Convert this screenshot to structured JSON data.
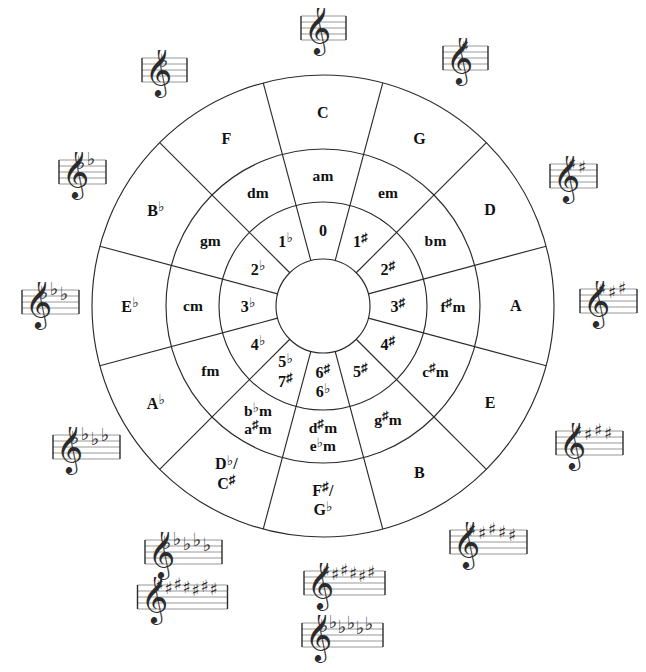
{
  "diagram": {
    "line_color": "#2b2b2b",
    "text_color": "#111111",
    "background": "#ffffff"
  },
  "rings": {
    "outer_major": {
      "name": "major-keys-ring",
      "sectors": [
        {
          "id": "C",
          "text": "C",
          "html": "C"
        },
        {
          "id": "G",
          "text": "G",
          "html": "G"
        },
        {
          "id": "D",
          "text": "D",
          "html": "D"
        },
        {
          "id": "A",
          "text": "A",
          "html": "A"
        },
        {
          "id": "E",
          "text": "E",
          "html": "E"
        },
        {
          "id": "B",
          "text": "B",
          "html": "B"
        },
        {
          "id": "Fs-Gb",
          "text": "F♯ / G♭",
          "html": "F<span class=\"acc-sup\">♯</span>/<span class=\"stack-line\">G<span class=\"acc\">♭</span></span>"
        },
        {
          "id": "Db-Cs",
          "text": "D♭ / C♯",
          "html": "D<span class=\"acc\">♭</span>/<span class=\"stack-line\">C<span class=\"acc-sup\">♯</span></span>"
        },
        {
          "id": "Ab",
          "text": "A♭",
          "html": "A<span class=\"acc\">♭</span>"
        },
        {
          "id": "Eb",
          "text": "E♭",
          "html": "E<span class=\"acc\">♭</span>"
        },
        {
          "id": "Bb",
          "text": "B♭",
          "html": "B<span class=\"acc\">♭</span>"
        },
        {
          "id": "F",
          "text": "F",
          "html": "F"
        }
      ]
    },
    "middle_minor": {
      "name": "relative-minor-keys-ring",
      "sectors": [
        {
          "id": "am",
          "text": "am",
          "html": "am"
        },
        {
          "id": "em",
          "text": "em",
          "html": "em"
        },
        {
          "id": "bm",
          "text": "bm",
          "html": "bm"
        },
        {
          "id": "fsm",
          "text": "f♯m",
          "html": "f<span class=\"acc-sup\">♯</span>m"
        },
        {
          "id": "csm",
          "text": "c♯m",
          "html": "c<span class=\"acc-sup\">♯</span>m"
        },
        {
          "id": "gsm",
          "text": "g♯m",
          "html": "g<span class=\"acc-sup\">♯</span>m"
        },
        {
          "id": "dsm-ebm",
          "text": "d♯m / e♭m",
          "html": "d<span class=\"acc-sup\">♯</span>m<span class=\"stack-line\">e<span class=\"acc\">♭</span>m</span>"
        },
        {
          "id": "bbm-asm",
          "text": "b♭m / a♯m",
          "html": "b<span class=\"acc\">♭</span>m<span class=\"stack-line\">a<span class=\"acc-sup\">♯</span>m</span>"
        },
        {
          "id": "fm",
          "text": "fm",
          "html": "fm"
        },
        {
          "id": "cm",
          "text": "cm",
          "html": "cm"
        },
        {
          "id": "gm",
          "text": "gm",
          "html": "gm"
        },
        {
          "id": "dm",
          "text": "dm",
          "html": "dm"
        }
      ]
    },
    "inner_counts": {
      "name": "accidental-count-ring",
      "sectors": [
        {
          "id": "0",
          "text": "0",
          "html": "0"
        },
        {
          "id": "1s",
          "text": "1♯",
          "html": "1<span class=\"acc-sup\">♯</span>"
        },
        {
          "id": "2s",
          "text": "2♯",
          "html": "2<span class=\"acc-sup\">♯</span>"
        },
        {
          "id": "3s",
          "text": "3♯",
          "html": "3<span class=\"acc-sup\">♯</span>"
        },
        {
          "id": "4s",
          "text": "4♯",
          "html": "4<span class=\"acc-sup\">♯</span>"
        },
        {
          "id": "5s",
          "text": "5♯",
          "html": "5<span class=\"acc-sup\">♯</span>"
        },
        {
          "id": "6s-6b",
          "text": "6♯ / 6♭",
          "html": "6<span class=\"acc-sup\">♯</span><span class=\"stack-line\">6<span class=\"acc\">♭</span></span>"
        },
        {
          "id": "5b-7s",
          "text": "5♭ / 7♯",
          "html": "5<span class=\"acc\">♭</span><span class=\"stack-line\">7<span class=\"acc-sup\">♯</span></span>"
        },
        {
          "id": "4b",
          "text": "4♭",
          "html": "4<span class=\"acc\">♭</span>"
        },
        {
          "id": "3b",
          "text": "3♭",
          "html": "3<span class=\"acc\">♭</span>"
        },
        {
          "id": "2b",
          "text": "2♭",
          "html": "2<span class=\"acc\">♭</span>"
        },
        {
          "id": "1b",
          "text": "1♭",
          "html": "1<span class=\"acc\">♭</span>"
        }
      ]
    }
  },
  "key_signatures": [
    {
      "id": "ks-C",
      "key": "C",
      "accidental": "none",
      "count": 0,
      "label": "C major — no sharps or flats"
    },
    {
      "id": "ks-G",
      "key": "G",
      "accidental": "sharp",
      "count": 1,
      "label": "G major — 1 sharp"
    },
    {
      "id": "ks-D",
      "key": "D",
      "accidental": "sharp",
      "count": 2,
      "label": "D major — 2 sharps"
    },
    {
      "id": "ks-A",
      "key": "A",
      "accidental": "sharp",
      "count": 3,
      "label": "A major — 3 sharps"
    },
    {
      "id": "ks-E",
      "key": "E",
      "accidental": "sharp",
      "count": 4,
      "label": "E major — 4 sharps"
    },
    {
      "id": "ks-B",
      "key": "B",
      "accidental": "sharp",
      "count": 5,
      "label": "B major — 5 sharps"
    },
    {
      "id": "ks-Fsharp",
      "key": "F♯",
      "accidental": "sharp",
      "count": 6,
      "label": "F-sharp major — 6 sharps"
    },
    {
      "id": "ks-Gflat",
      "key": "G♭",
      "accidental": "flat",
      "count": 6,
      "label": "G-flat major — 6 flats"
    },
    {
      "id": "ks-Csharp",
      "key": "C♯",
      "accidental": "sharp",
      "count": 7,
      "label": "C-sharp major — 7 sharps"
    },
    {
      "id": "ks-Dflat",
      "key": "D♭",
      "accidental": "flat",
      "count": 5,
      "label": "D-flat major — 5 flats"
    },
    {
      "id": "ks-Aflat",
      "key": "A♭",
      "accidental": "flat",
      "count": 4,
      "label": "A-flat major — 4 flats"
    },
    {
      "id": "ks-Eflat",
      "key": "E♭",
      "accidental": "flat",
      "count": 3,
      "label": "E-flat major — 3 flats"
    },
    {
      "id": "ks-Bflat",
      "key": "B♭",
      "accidental": "flat",
      "count": 2,
      "label": "B-flat major — 2 flats"
    },
    {
      "id": "ks-F",
      "key": "F",
      "accidental": "flat",
      "count": 1,
      "label": "F major — 1 flat"
    }
  ],
  "layout": {
    "center_x": 323,
    "center_y": 306,
    "radii": {
      "outer": 231,
      "major_inner": 157,
      "minor_inner": 104,
      "hub": 47
    },
    "label_radii": {
      "major": 193,
      "minor": 130,
      "count": 75
    },
    "rotation_offset_deg": -90,
    "sector_span_deg": 30,
    "keysig_positions": [
      {
        "id": "ks-C",
        "x": 323,
        "y": 32
      },
      {
        "id": "ks-G",
        "x": 465,
        "y": 62
      },
      {
        "id": "ks-D",
        "x": 573,
        "y": 180
      },
      {
        "id": "ks-A",
        "x": 608,
        "y": 305
      },
      {
        "id": "ks-E",
        "x": 589,
        "y": 447
      },
      {
        "id": "ks-B",
        "x": 488,
        "y": 546
      },
      {
        "id": "ks-Fsharp",
        "x": 344,
        "y": 587
      },
      {
        "id": "ks-Gflat",
        "x": 342,
        "y": 639
      },
      {
        "id": "ks-Csharp",
        "x": 182,
        "y": 601
      },
      {
        "id": "ks-Dflat",
        "x": 183,
        "y": 556
      },
      {
        "id": "ks-Aflat",
        "x": 86,
        "y": 451
      },
      {
        "id": "ks-Eflat",
        "x": 50,
        "y": 306
      },
      {
        "id": "ks-Bflat",
        "x": 82,
        "y": 176
      },
      {
        "id": "ks-F",
        "x": 164,
        "y": 74
      }
    ]
  }
}
